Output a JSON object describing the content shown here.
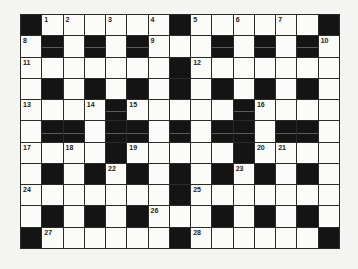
{
  "puzzle": {
    "type": "crossword",
    "rows": 11,
    "cols": 15,
    "colors": {
      "black_cell": "#141414",
      "white_cell": "#fbfbfa",
      "grid_line": "#2a2a2a",
      "background": "#f4f4f2"
    },
    "grid": [
      [
        "#",
        "1",
        "2",
        ".",
        "3",
        ".",
        "4",
        "#",
        "5",
        ".",
        "6",
        ".",
        "7",
        ".",
        "#"
      ],
      [
        "8",
        "#",
        ".",
        "#",
        ".",
        "#",
        "9",
        ".",
        ".",
        "#",
        ".",
        "#",
        ".",
        "#",
        "10"
      ],
      [
        "11",
        ".",
        ".",
        ".",
        ".",
        ".",
        ".",
        "#",
        "12",
        ".",
        ".",
        ".",
        ".",
        ".",
        "."
      ],
      [
        ".",
        "#",
        ".",
        "#",
        ".",
        "#",
        ".",
        "#",
        ".",
        "#",
        ".",
        "#",
        ".",
        "#",
        "."
      ],
      [
        "13",
        ".",
        ".",
        "14",
        "#",
        "15",
        ".",
        ".",
        ".",
        ".",
        "#",
        "16",
        ".",
        ".",
        "."
      ],
      [
        ".",
        "#",
        "#",
        ".",
        "#",
        "#",
        ".",
        "#",
        ".",
        "#",
        "#",
        ".",
        "#",
        "#",
        "."
      ],
      [
        "17",
        ".",
        "18",
        ".",
        "#",
        "19",
        ".",
        ".",
        ".",
        ".",
        "#",
        "20",
        "21",
        ".",
        "."
      ],
      [
        ".",
        "#",
        ".",
        "#",
        "22",
        "#",
        ".",
        "#",
        ".",
        "#",
        "23",
        "#",
        ".",
        "#",
        "."
      ],
      [
        "24",
        ".",
        ".",
        ".",
        ".",
        ".",
        ".",
        "#",
        "25",
        ".",
        ".",
        ".",
        ".",
        ".",
        "."
      ],
      [
        ".",
        "#",
        ".",
        "#",
        ".",
        "#",
        "26",
        ".",
        ".",
        "#",
        ".",
        "#",
        ".",
        "#",
        "."
      ],
      [
        "#",
        "27",
        ".",
        ".",
        ".",
        ".",
        ".",
        "#",
        "28",
        ".",
        ".",
        ".",
        ".",
        ".",
        "#"
      ]
    ],
    "scan_artifact_rows": [
      1,
      4,
      5
    ]
  }
}
